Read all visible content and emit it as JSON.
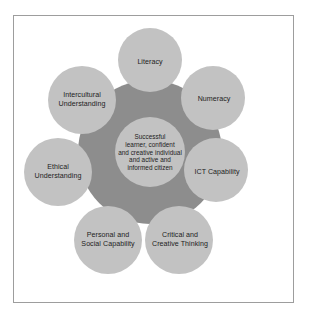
{
  "figure": {
    "kind": "concentric-capabilities-diagram",
    "frame": {
      "border_color": "#9d9d9d",
      "background_color": "#ffffff"
    },
    "colors": {
      "hub_fill": "#8d8d8d",
      "petal_fill": "#c2c2c2",
      "center_fill": "#c2c2c2",
      "text": "#1d1d1d"
    }
  },
  "center": {
    "label": "Successful\nlearner, confident\nand creative individual\nand active and\ninformed citizen",
    "cx": 150,
    "cy": 152,
    "r": 35
  },
  "petals": [
    {
      "id": "literacy",
      "label": "Literacy",
      "cx": 150,
      "cy": 60,
      "r": 32,
      "angle_deg": 270
    },
    {
      "id": "numeracy",
      "label": "Numeracy",
      "cx": 213,
      "cy": 98,
      "r": 32,
      "angle_deg": 330
    },
    {
      "id": "ict-capability",
      "label": "ICT Capability",
      "cx": 216,
      "cy": 170,
      "r": 32,
      "angle_deg": 30
    },
    {
      "id": "critical-creative-thinking",
      "label": "Critical and\nCreative Thinking",
      "cx": 179,
      "cy": 240,
      "r": 34,
      "angle_deg": 80
    },
    {
      "id": "personal-social-capability",
      "label": "Personal and\nSocial Capability",
      "cx": 108,
      "cy": 240,
      "r": 34,
      "angle_deg": 100
    },
    {
      "id": "ethical-understanding",
      "label": "Ethical\nUnderstanding",
      "cx": 58,
      "cy": 172,
      "r": 34,
      "angle_deg": 150
    },
    {
      "id": "intercultural-understanding",
      "label": "Intercultural\nUnderstanding",
      "cx": 82,
      "cy": 100,
      "r": 34,
      "angle_deg": 210
    }
  ],
  "hub": {
    "cx": 150,
    "cy": 152,
    "r": 72
  }
}
